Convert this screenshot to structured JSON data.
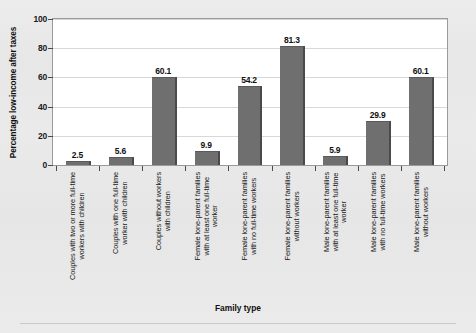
{
  "chart_data": {
    "type": "bar",
    "title": "",
    "xlabel": "Family type",
    "ylabel": "Percentage low-income after taxes",
    "ylim": [
      0,
      100
    ],
    "yticks": [
      0,
      20,
      40,
      60,
      80,
      100
    ],
    "grid": true,
    "legend": "none",
    "bar_color": "#6f6f6f",
    "categories": [
      "Couples with two or more full-time workers with children",
      "Couples with one full-time worker with children",
      "Couples without workers with children",
      "Female lone-parent families with at least one full-time worker",
      "Female lone-parent families with no full-time workers",
      "Female lone-parent families without workers",
      "Male lone-parent families with at least one full-time worker",
      "Male lone-parent families with no full-time workers",
      "Male lone-parent families without workers"
    ],
    "category_lines": [
      [
        "Couples with two or more full-time",
        "workers with children"
      ],
      [
        "Couples with one full-time",
        "worker with children"
      ],
      [
        "Couples without workers",
        "with children"
      ],
      [
        "Female lone-parent families",
        "with at least one full-time",
        "worker"
      ],
      [
        "Female lone-parent families",
        "with no full-time workers"
      ],
      [
        "Female lone-parent families",
        "without workers"
      ],
      [
        "Male lone-parent families",
        "with at least one full-time",
        "worker"
      ],
      [
        "Male lone-parent families",
        "with no full-time workers"
      ],
      [
        "Male lone-parent families",
        "without workers"
      ]
    ],
    "values": [
      2.5,
      5.6,
      60.1,
      9.9,
      54.2,
      81.3,
      5.9,
      29.9,
      60.1
    ],
    "value_labels": [
      "2.5",
      "5.6",
      "60.1",
      "9.9",
      "54.2",
      "81.3",
      "5.9",
      "29.9",
      "60.1"
    ]
  }
}
